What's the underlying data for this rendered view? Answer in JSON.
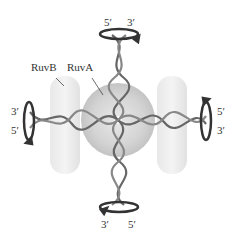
{
  "diagram": {
    "labels": {
      "ruvb": "RuvB",
      "ruva": "RuvA"
    },
    "strand_ends": {
      "top_left": "5′",
      "top_right": "3′",
      "left_top": "3′",
      "left_bottom": "5′",
      "right_top": "5′",
      "right_bottom": "3′",
      "bottom_left": "3′",
      "bottom_right": "5′"
    },
    "colors": {
      "protein": "#d8d8d8",
      "ruva": "#c8c8c8",
      "dna": "#555555",
      "arrow": "#333333"
    }
  }
}
